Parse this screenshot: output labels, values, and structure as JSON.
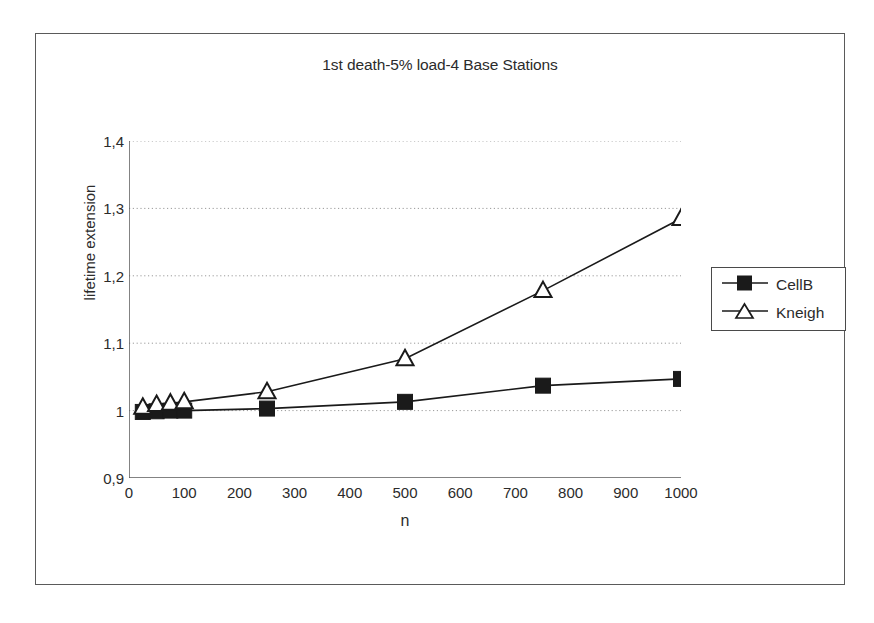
{
  "chart_data": {
    "type": "line",
    "title": "1st death-5% load-4 Base Stations",
    "xlabel": "n",
    "ylabel": "lifetime extension",
    "xlim": [
      0,
      1000
    ],
    "ylim": [
      0.9,
      1.4
    ],
    "xticks": [
      0,
      100,
      200,
      300,
      400,
      500,
      600,
      700,
      800,
      900,
      1000
    ],
    "xtick_labels": [
      "0",
      "100",
      "200",
      "300",
      "400",
      "500",
      "600",
      "700",
      "800",
      "900",
      "1000"
    ],
    "yticks": [
      0.9,
      1.0,
      1.1,
      1.2,
      1.3,
      1.4
    ],
    "ytick_labels": [
      "0,9",
      "1",
      "1,1",
      "1,2",
      "1,3",
      "1,4"
    ],
    "grid": "horizontal-dotted",
    "legend_position": "right",
    "x": [
      25,
      50,
      75,
      100,
      250,
      500,
      750,
      1000
    ],
    "series": [
      {
        "name": "CellB",
        "marker": "filled-square",
        "color": "#1a1a1a",
        "values": [
          0.998,
          0.999,
          1.0,
          1.0,
          1.003,
          1.013,
          1.037,
          1.047
        ]
      },
      {
        "name": "Kneigh",
        "marker": "open-triangle",
        "color": "#1a1a1a",
        "values": [
          1.005,
          1.009,
          1.011,
          1.013,
          1.028,
          1.077,
          1.178,
          1.285
        ]
      }
    ]
  },
  "legend": {
    "items": [
      {
        "label": "CellB",
        "marker": "filled-square"
      },
      {
        "label": "Kneigh",
        "marker": "open-triangle"
      }
    ]
  }
}
